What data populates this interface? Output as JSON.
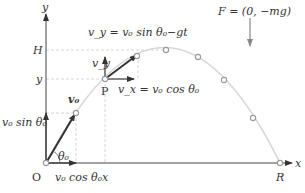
{
  "diagram": {
    "axes": {
      "x_label": "x",
      "y_label": "y",
      "origin_label": "O"
    },
    "levels": {
      "max_height_label": "H",
      "y_label": "y",
      "x_label": "x",
      "range_label": "R"
    },
    "point_label": "P",
    "initial_velocity": {
      "label": "v₀",
      "angle_label": "θ₀",
      "vertical_component": "v₀ sin θ₀",
      "horizontal_component": "v₀ cos θ₀"
    },
    "velocity_at_P": {
      "vy_symbol": "v_y",
      "vy_equation": "v_y = v₀ sin θ₀−gt",
      "vx_equation": "v_x = v₀ cos θ₀"
    },
    "force": {
      "equation": "F = (0, −mg)"
    },
    "trajectory_points": [
      [
        46,
        163
      ],
      [
        76,
        113
      ],
      [
        105,
        79
      ],
      [
        137,
        52
      ],
      [
        166,
        47
      ],
      [
        198,
        57
      ],
      [
        224,
        80
      ],
      [
        253,
        118
      ],
      [
        280,
        163
      ]
    ],
    "colors": {
      "axis": "#444444",
      "trajectory": "#d8d8d8",
      "guide": "#cccccc",
      "arrow": "#333333",
      "marker": "#999999"
    }
  }
}
